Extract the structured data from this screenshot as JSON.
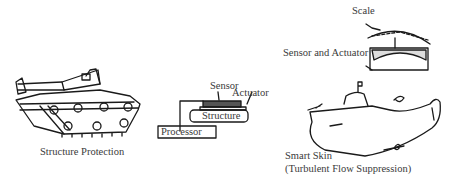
{
  "diagram": {
    "panels": [
      {
        "id": "tank",
        "caption": "Structure Protection"
      },
      {
        "id": "smart-structure",
        "labels": {
          "sensor": "Sensor",
          "actuator": "Actuator",
          "structure": "Structure",
          "processor": "Processor"
        }
      },
      {
        "id": "submarine",
        "labels": {
          "scale": "Scale",
          "sensor_actuator": "Sensor and Actuator"
        },
        "caption_line1": "Smart Skin",
        "caption_line2": "(Turbulent Flow Suppression)"
      }
    ]
  }
}
